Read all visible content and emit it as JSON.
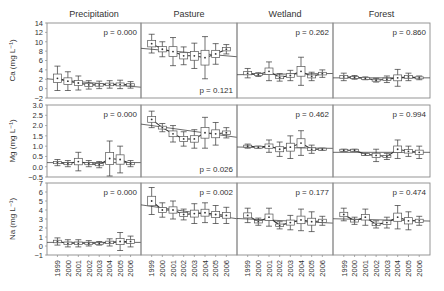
{
  "chart_data": {
    "type": "scatter",
    "title": "",
    "layout": "3x4 panel grid (rows: variables, columns: land use)",
    "columns": [
      "Precipitation",
      "Pasture",
      "Wetland",
      "Forest"
    ],
    "x": [
      "1999",
      "2000",
      "2001",
      "2002",
      "2003",
      "2004",
      "2005",
      "2006"
    ],
    "xlabel": "",
    "rows": [
      {
        "ylabel": "Ca (mg L⁻¹)",
        "ylim": [
          -2,
          14
        ],
        "yticks": [
          -2,
          0,
          2,
          4,
          6,
          8,
          10,
          12,
          14
        ],
        "ytick_labels": [
          "−2",
          "0",
          "2",
          "4",
          "6",
          "8",
          "10",
          "12",
          "14"
        ],
        "panels": [
          {
            "column": "Precipitation",
            "p_label": "p = 0.000",
            "p_pos": "top",
            "values": [
              2.2,
              1.6,
              1.2,
              0.8,
              0.8,
              0.9,
              0.9,
              0.8
            ],
            "err": [
              2.6,
              2.0,
              1.5,
              0.9,
              0.8,
              0.8,
              0.9,
              0.7
            ],
            "trend": [
              1.9,
              0.5
            ]
          },
          {
            "column": "Pasture",
            "p_label": "p = 0.121",
            "p_pos": "bottom",
            "values": [
              9.6,
              8.4,
              7.9,
              7.0,
              7.0,
              6.6,
              7.4,
              8.4
            ],
            "err": [
              2.0,
              1.6,
              3.0,
              1.9,
              2.7,
              4.5,
              2.2,
              1.0
            ],
            "trend": [
              8.4,
              7.0
            ]
          },
          {
            "column": "Wetland",
            "p_label": "p = 0.262",
            "p_pos": "top",
            "values": [
              3.3,
              3.0,
              3.7,
              2.4,
              2.8,
              3.7,
              2.6,
              3.2
            ],
            "err": [
              1.0,
              0.4,
              2.0,
              0.8,
              1.1,
              3.0,
              0.9,
              0.8
            ],
            "trend": [
              3.0,
              3.2
            ]
          },
          {
            "column": "Forest",
            "p_label": "p = 0.860",
            "p_pos": "top",
            "values": [
              2.5,
              2.4,
              2.2,
              1.8,
              2.0,
              2.3,
              2.5,
              2.3
            ],
            "err": [
              0.8,
              0.4,
              0.3,
              0.4,
              0.7,
              1.8,
              0.8,
              0.4
            ],
            "trend": [
              2.3,
              2.3
            ]
          }
        ]
      },
      {
        "ylabel": "Mg (mg L⁻¹)",
        "ylim": [
          -0.5,
          3.0
        ],
        "yticks": [
          -0.5,
          0.0,
          0.5,
          1.0,
          1.5,
          2.0,
          2.5,
          3.0
        ],
        "ytick_labels": [
          "−0.5",
          "0.0",
          "0.5",
          "1.0",
          "1.5",
          "2.0",
          "2.5",
          "3.0"
        ],
        "panels": [
          {
            "column": "Precipitation",
            "p_label": "p = 0.000",
            "p_pos": "top",
            "values": [
              0.2,
              0.15,
              0.25,
              0.15,
              0.1,
              0.4,
              0.35,
              0.15
            ],
            "err": [
              0.15,
              0.15,
              0.45,
              0.15,
              0.15,
              0.85,
              0.65,
              0.15
            ],
            "trend": [
              0.2,
              0.2
            ]
          },
          {
            "column": "Pasture",
            "p_label": "p = 0.026",
            "p_pos": "bottom",
            "values": [
              2.3,
              1.9,
              1.6,
              1.35,
              1.35,
              1.65,
              1.6,
              1.65
            ],
            "err": [
              0.4,
              0.2,
              0.4,
              0.35,
              0.45,
              0.75,
              0.55,
              0.25
            ],
            "trend": [
              2.0,
              1.5
            ]
          },
          {
            "column": "Wetland",
            "p_label": "p = 0.462",
            "p_pos": "top",
            "values": [
              1.0,
              0.95,
              1.0,
              0.85,
              0.95,
              1.15,
              0.85,
              0.85
            ],
            "err": [
              0.1,
              0.05,
              0.3,
              0.35,
              0.55,
              0.6,
              0.2,
              0.05
            ],
            "trend": [
              0.95,
              0.9
            ]
          },
          {
            "column": "Forest",
            "p_label": "p = 0.994",
            "p_pos": "top",
            "values": [
              0.8,
              0.8,
              0.6,
              0.55,
              0.5,
              0.85,
              0.75,
              0.7
            ],
            "err": [
              0.05,
              0.05,
              0.05,
              0.3,
              0.15,
              0.45,
              0.25,
              0.3
            ],
            "trend": [
              0.7,
              0.7
            ]
          }
        ]
      },
      {
        "ylabel": "Na (mg L⁻¹)",
        "ylim": [
          -1,
          7
        ],
        "yticks": [
          -1,
          0,
          1,
          2,
          3,
          4,
          5,
          6,
          7
        ],
        "ytick_labels": [
          "−1",
          "0",
          "1",
          "2",
          "3",
          "4",
          "5",
          "6",
          "7"
        ],
        "panels": [
          {
            "column": "Precipitation",
            "p_label": "p = 0.000",
            "p_pos": "top",
            "values": [
              0.5,
              0.3,
              0.3,
              0.3,
              0.3,
              0.4,
              0.5,
              0.5
            ],
            "err": [
              0.4,
              0.4,
              0.4,
              0.3,
              0.2,
              0.4,
              1.0,
              0.6
            ],
            "trend": [
              0.4,
              0.4
            ]
          },
          {
            "column": "Pasture",
            "p_label": "p = 0.002",
            "p_pos": "top",
            "values": [
              5.0,
              4.0,
              4.0,
              3.5,
              3.6,
              3.7,
              3.5,
              3.4
            ],
            "err": [
              1.5,
              0.8,
              1.0,
              0.6,
              1.1,
              1.1,
              1.0,
              0.9
            ],
            "trend": [
              4.4,
              3.2
            ]
          },
          {
            "column": "Wetland",
            "p_label": "p = 0.177",
            "p_pos": "top",
            "values": [
              3.4,
              2.7,
              3.2,
              2.3,
              2.6,
              2.9,
              2.7,
              2.8
            ],
            "err": [
              0.8,
              0.4,
              1.0,
              0.4,
              0.8,
              1.2,
              1.1,
              0.5
            ],
            "trend": [
              3.0,
              2.6
            ]
          },
          {
            "column": "Forest",
            "p_label": "p = 0.474",
            "p_pos": "top",
            "values": [
              3.5,
              2.8,
              3.2,
              2.4,
              2.6,
              3.2,
              2.8,
              2.8
            ],
            "err": [
              0.7,
              0.4,
              0.9,
              0.4,
              0.6,
              1.3,
              1.0,
              0.5
            ],
            "trend": [
              3.0,
              2.8
            ]
          }
        ]
      }
    ]
  },
  "colors": {
    "frame": "#8a8a8a",
    "text": "#333333",
    "marker": "#333333",
    "box": "#555555",
    "trend": "#444444"
  }
}
